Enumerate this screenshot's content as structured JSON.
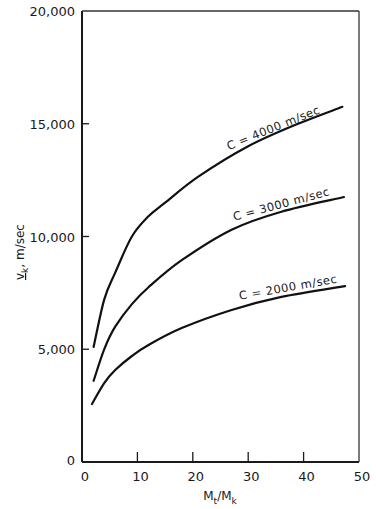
{
  "chart_data": {
    "type": "line",
    "title": "",
    "xlabel": "M_t/M_k",
    "xlabel_main": "M",
    "xlabel_sub1": "t",
    "xlabel_sep": "/M",
    "xlabel_sub2": "k",
    "ylabel": "v_k, m/sec",
    "ylabel_main": "v",
    "ylabel_sub": "k",
    "ylabel_unit": ",  m/sec",
    "xlim": [
      0,
      50
    ],
    "ylim": [
      0,
      20000
    ],
    "x_ticks": [
      0,
      10,
      20,
      30,
      40,
      50
    ],
    "x_tick_labels": [
      "0",
      "10",
      "20",
      "30",
      "40",
      "50"
    ],
    "y_ticks": [
      0,
      5000,
      10000,
      15000,
      20000
    ],
    "y_tick_labels": [
      "0",
      "5,000",
      "10,000",
      "15,000",
      "20,000"
    ],
    "grid": false,
    "legend": "inline labels on curves",
    "series": [
      {
        "name": "C = 4000 m/sec",
        "label": "C = 4000  m/sec",
        "x": [
          2.1,
          4,
          6,
          9,
          12,
          15,
          21,
          30,
          39,
          47
        ],
        "y": [
          5100,
          7200,
          8400,
          10000,
          10900,
          11500,
          12650,
          14000,
          15000,
          15750
        ]
      },
      {
        "name": "C = 3000 m/sec",
        "label": "C = 3000  m/sec",
        "x": [
          2.1,
          4,
          6,
          9,
          12,
          18,
          27,
          36,
          47.3
        ],
        "y": [
          3600,
          5000,
          6000,
          7000,
          7750,
          8950,
          10300,
          11100,
          11750
        ]
      },
      {
        "name": "C = 2000 m/sec",
        "label": "C = 2000  m/sec",
        "x": [
          1.8,
          4,
          6,
          9,
          12,
          18,
          27,
          36,
          47.5
        ],
        "y": [
          2570,
          3500,
          4080,
          4700,
          5190,
          5940,
          6740,
          7320,
          7800
        ]
      }
    ]
  }
}
